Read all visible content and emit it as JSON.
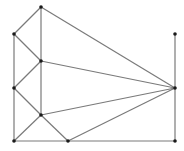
{
  "diagram": {
    "type": "graph",
    "width": 184,
    "height": 151,
    "edge_color": "#7a7a7a",
    "node_color": "#1a1a1a",
    "nodes": [
      {
        "id": "A",
        "x": 41,
        "y": 7
      },
      {
        "id": "B",
        "x": 14,
        "y": 34
      },
      {
        "id": "C",
        "x": 41,
        "y": 61
      },
      {
        "id": "D",
        "x": 14,
        "y": 88
      },
      {
        "id": "E",
        "x": 41,
        "y": 115
      },
      {
        "id": "F",
        "x": 14,
        "y": 141
      },
      {
        "id": "G",
        "x": 68,
        "y": 141
      },
      {
        "id": "H",
        "x": 175,
        "y": 141
      },
      {
        "id": "I",
        "x": 175,
        "y": 88
      },
      {
        "id": "J",
        "x": 175,
        "y": 34
      }
    ],
    "edges": [
      [
        "A",
        "B"
      ],
      [
        "A",
        "C"
      ],
      [
        "A",
        "I"
      ],
      [
        "B",
        "F"
      ],
      [
        "B",
        "C"
      ],
      [
        "C",
        "I"
      ],
      [
        "C",
        "D"
      ],
      [
        "C",
        "E"
      ],
      [
        "D",
        "E"
      ],
      [
        "E",
        "F"
      ],
      [
        "E",
        "G"
      ],
      [
        "E",
        "I"
      ],
      [
        "F",
        "G"
      ],
      [
        "G",
        "H"
      ],
      [
        "G",
        "I"
      ],
      [
        "H",
        "I"
      ],
      [
        "I",
        "J"
      ]
    ]
  }
}
